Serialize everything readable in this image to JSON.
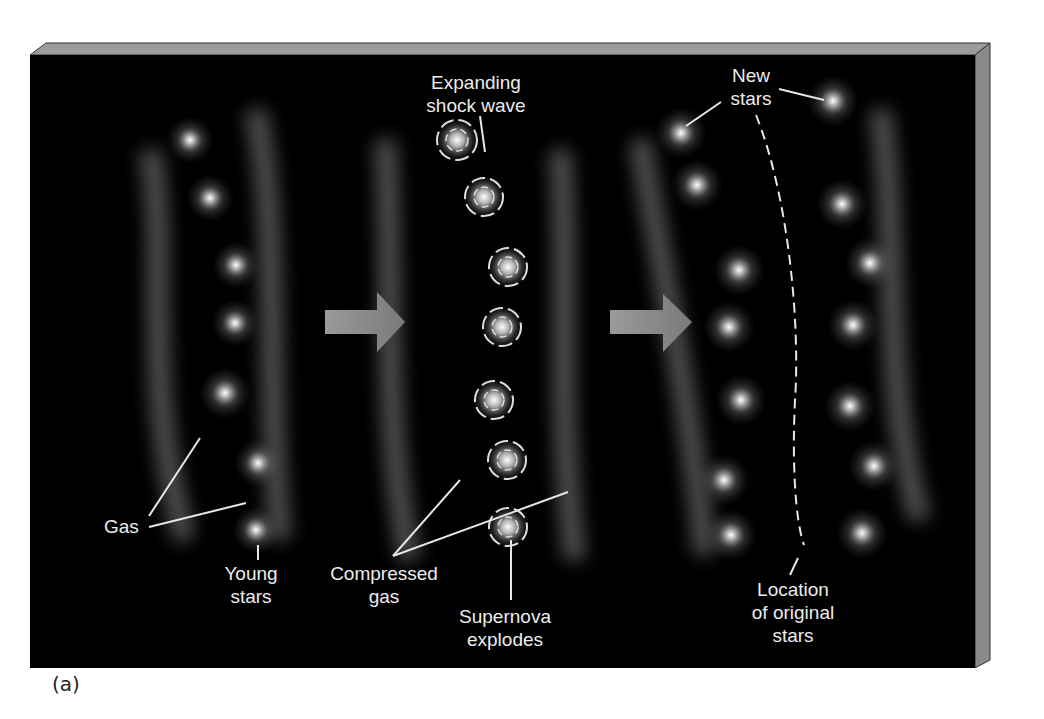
{
  "figure": {
    "panel_label": "(a)",
    "colors": {
      "background": "#000000",
      "board_top": "#9a9a9a",
      "board_side": "#8a8a8a",
      "text": "#ececec",
      "arrow": "#8c8c8c"
    },
    "stage1": {
      "labels": {
        "gas": "Gas",
        "young_stars_1": "Young",
        "young_stars_2": "stars"
      }
    },
    "stage2": {
      "labels": {
        "shock_1": "Expanding",
        "shock_2": "shock wave",
        "compressed_1": "Compressed",
        "compressed_2": "gas",
        "supernova_1": "Supernova",
        "supernova_2": "explodes"
      }
    },
    "stage3": {
      "labels": {
        "new_stars_1": "New",
        "new_stars_2": "stars",
        "location_1": "Location",
        "location_2": "of original",
        "location_3": "stars"
      }
    }
  }
}
